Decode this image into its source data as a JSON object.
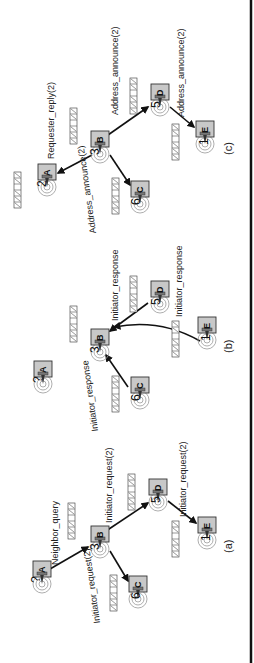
{
  "figure": {
    "orientation": "rotated-90-ccw",
    "panels": [
      {
        "id": "a",
        "caption": "(a)",
        "nodes": [
          {
            "letter": "A",
            "number": "?",
            "x": 86,
            "y": 42
          },
          {
            "letter": "B",
            "number": "3",
            "x": 121,
            "y": 100
          },
          {
            "letter": "C",
            "number": "6",
            "x": 71,
            "y": 138
          },
          {
            "letter": "D",
            "number": "5",
            "x": 168,
            "y": 158
          },
          {
            "letter": "E",
            "number": "1",
            "x": 130,
            "y": 207
          }
        ],
        "edges": [
          {
            "from": "A",
            "to": "B",
            "label": "Neighbor_query"
          },
          {
            "from": "B",
            "to": "C",
            "label": "Initiator_request(2)"
          },
          {
            "from": "B",
            "to": "D",
            "label": "Initiator_request(2)"
          },
          {
            "from": "D",
            "to": "E",
            "label": "Initiator_request(2)"
          }
        ]
      },
      {
        "id": "b",
        "caption": "(b)",
        "nodes": [
          {
            "letter": "A",
            "number": "?",
            "x": 286,
            "y": 43
          },
          {
            "letter": "B",
            "number": "3",
            "x": 318,
            "y": 100
          },
          {
            "letter": "C",
            "number": "6",
            "x": 270,
            "y": 140
          },
          {
            "letter": "D",
            "number": "5",
            "x": 366,
            "y": 160
          },
          {
            "letter": "E",
            "number": "1",
            "x": 330,
            "y": 207
          }
        ],
        "edges": [
          {
            "from": "C",
            "to": "B",
            "label": "Initiator_response"
          },
          {
            "from": "D",
            "to": "B",
            "label": "Initiator_response"
          },
          {
            "from": "E",
            "to": "B",
            "label": "Initiator_response"
          }
        ]
      },
      {
        "id": "c",
        "caption": "(c)",
        "nodes": [
          {
            "letter": "A",
            "number": "2",
            "x": 483,
            "y": 47
          },
          {
            "letter": "B",
            "number": "3",
            "x": 516,
            "y": 100
          },
          {
            "letter": "C",
            "number": "6",
            "x": 466,
            "y": 140
          },
          {
            "letter": "D",
            "number": "5",
            "x": 563,
            "y": 160
          },
          {
            "letter": "E",
            "number": "1",
            "x": 526,
            "y": 205
          }
        ],
        "edges": [
          {
            "from": "B",
            "to": "A",
            "label": "Requester_reply(2)"
          },
          {
            "from": "B",
            "to": "C",
            "label": "Address_announce(2)"
          },
          {
            "from": "B",
            "to": "D",
            "label": "Address_announce(2)"
          },
          {
            "from": "D",
            "to": "E",
            "label": "Address_announce(2)"
          }
        ]
      }
    ],
    "address_table_cells": [
      "1",
      "2",
      "3",
      "4",
      "5",
      "6"
    ],
    "address_table_struck": [
      true,
      true,
      true,
      false,
      true,
      true
    ]
  },
  "labels": {
    "a_neighbor_query": "Neighbor_query",
    "a_bc": "Initiator_request(2)",
    "a_bd": "Initiator_request(2)",
    "a_de": "Initiator_request(2)",
    "b_cb": "Initiator_response",
    "b_db": "Initiator_response",
    "b_eb": "Initiator_response",
    "c_ba": "Requester_reply(2)",
    "c_bc": "Address_announce(2)",
    "c_bd": "Address_announce(2)",
    "c_de": "Address_announce(2)",
    "cap_a": "(a)",
    "cap_b": "(b)",
    "cap_c": "(c)",
    "a_A_num": "?",
    "a_B_num": "3",
    "a_C_num": "6",
    "a_D_num": "5",
    "a_E_num": "1",
    "b_A_num": "?",
    "b_B_num": "3",
    "b_C_num": "6",
    "b_D_num": "5",
    "b_E_num": "1",
    "c_A_num": "2",
    "c_B_num": "3",
    "c_C_num": "6",
    "c_D_num": "5",
    "c_E_num": "1",
    "A": "A",
    "B": "B",
    "C": "C",
    "D": "D",
    "E": "E",
    "cell1": "1",
    "cell2": "2",
    "cell3": "3",
    "cell4": "4",
    "cell5": "5",
    "cell6": "6"
  }
}
